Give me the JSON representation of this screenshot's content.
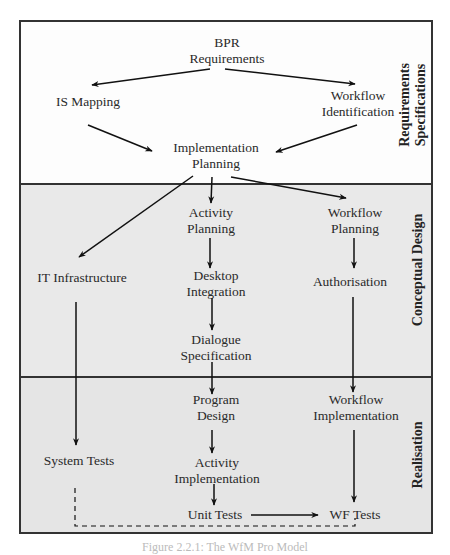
{
  "diagram": {
    "sections": [
      {
        "id": "requirements",
        "label_line1": "Requirements",
        "label_line2": "Specifications"
      },
      {
        "id": "conceptual",
        "label": "Conceptual Design"
      },
      {
        "id": "realisation",
        "label": "Realisation"
      }
    ],
    "nodes": {
      "bpr": {
        "line1": "BPR",
        "line2": "Requirements"
      },
      "is_mapping": {
        "line1": "IS Mapping"
      },
      "workflow_identification": {
        "line1": "Workflow",
        "line2": "Identification"
      },
      "implementation_planning": {
        "line1": "Implementation",
        "line2": "Planning"
      },
      "activity_planning": {
        "line1": "Activity",
        "line2": "Planning"
      },
      "workflow_planning": {
        "line1": "Workflow",
        "line2": "Planning"
      },
      "it_infrastructure": {
        "line1": "IT Infrastructure"
      },
      "desktop_integration": {
        "line1": "Desktop",
        "line2": "Integration"
      },
      "authorisation": {
        "line1": "Authorisation"
      },
      "dialogue_specification": {
        "line1": "Dialogue",
        "line2": "Specification"
      },
      "program_design": {
        "line1": "Program",
        "line2": "Design"
      },
      "workflow_implementation": {
        "line1": "Workflow",
        "line2": "Implementation"
      },
      "system_tests": {
        "line1": "System Tests"
      },
      "activity_implementation": {
        "line1": "Activity",
        "line2": "Implementation"
      },
      "unit_tests": {
        "line1": "Unit Tests"
      },
      "wf_tests": {
        "line1": "WF Tests"
      }
    },
    "edges": [
      [
        "bpr",
        "is_mapping"
      ],
      [
        "bpr",
        "workflow_identification"
      ],
      [
        "is_mapping",
        "implementation_planning"
      ],
      [
        "workflow_identification",
        "implementation_planning"
      ],
      [
        "implementation_planning",
        "it_infrastructure"
      ],
      [
        "implementation_planning",
        "activity_planning"
      ],
      [
        "implementation_planning",
        "workflow_planning"
      ],
      [
        "activity_planning",
        "desktop_integration"
      ],
      [
        "desktop_integration",
        "dialogue_specification"
      ],
      [
        "dialogue_specification",
        "program_design"
      ],
      [
        "workflow_planning",
        "authorisation"
      ],
      [
        "authorisation",
        "workflow_implementation"
      ],
      [
        "it_infrastructure",
        "system_tests"
      ],
      [
        "program_design",
        "activity_implementation"
      ],
      [
        "activity_implementation",
        "unit_tests"
      ],
      [
        "unit_tests",
        "wf_tests"
      ],
      [
        "workflow_implementation",
        "wf_tests"
      ],
      [
        "system_tests",
        "wf_tests",
        "dashed"
      ]
    ],
    "caption": "Figure 2.2.1: The WfM Pro Model"
  }
}
